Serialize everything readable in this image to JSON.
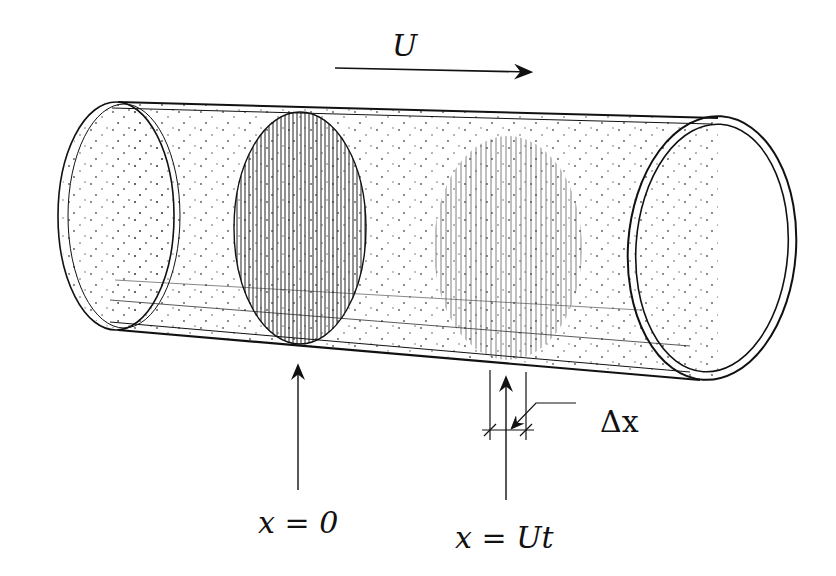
{
  "diagram": {
    "flow_label": "U",
    "delta_label": "Δx",
    "origin_label": "x = 0",
    "position_label": "x = Ut",
    "ink_color": "#111111",
    "background_color": "#ffffff"
  }
}
